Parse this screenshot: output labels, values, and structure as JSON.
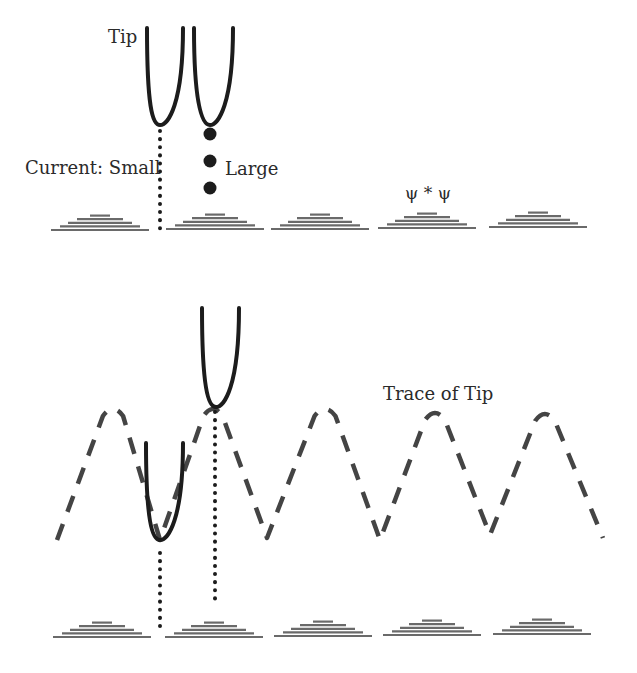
{
  "labels": {
    "tip": "Tip",
    "current_small": "Current: Small",
    "large": "Large",
    "psi": "ψ * ψ",
    "trace": "Trace of Tip"
  },
  "colors": {
    "ink": "#1c1c1c",
    "atom": "#6a6a6a",
    "trace": "#444444",
    "text": "#2a2a2a"
  },
  "top_panel": {
    "tips": [
      {
        "left_x": 147,
        "right_x": 183,
        "top_y": 28,
        "apex_x": 160,
        "apex_y": 125
      },
      {
        "left_x": 194,
        "right_x": 233,
        "top_y": 28,
        "apex_x": 210,
        "apex_y": 125
      }
    ],
    "small_current_line": {
      "x": 160,
      "y1": 131,
      "y2": 230
    },
    "large_current_dots": [
      {
        "x": 210,
        "y": 134
      },
      {
        "x": 210,
        "y": 161
      },
      {
        "x": 210,
        "y": 188
      }
    ],
    "atoms": [
      {
        "cx": 100,
        "base_y": 230
      },
      {
        "cx": 215,
        "base_y": 229
      },
      {
        "cx": 320,
        "base_y": 229
      },
      {
        "cx": 427,
        "base_y": 228
      },
      {
        "cx": 538,
        "base_y": 227
      }
    ]
  },
  "bottom_panel": {
    "tips": [
      {
        "left_x": 202,
        "right_x": 239,
        "top_y": 308,
        "apex_x": 216,
        "apex_y": 407
      },
      {
        "left_x": 146,
        "right_x": 183,
        "top_y": 443,
        "apex_x": 160,
        "apex_y": 540
      }
    ],
    "dotted_lines": [
      {
        "x": 160,
        "y1": 553,
        "y2": 627
      },
      {
        "x": 215,
        "y1": 412,
        "y2": 604
      }
    ],
    "trace_points": [
      [
        57,
        540
      ],
      [
        113,
        408
      ],
      [
        160,
        540
      ],
      [
        213,
        408
      ],
      [
        267,
        538
      ],
      [
        325,
        408
      ],
      [
        380,
        540
      ],
      [
        435,
        412
      ],
      [
        490,
        535
      ],
      [
        545,
        413
      ],
      [
        603,
        538
      ]
    ],
    "atoms": [
      {
        "cx": 102,
        "base_y": 637
      },
      {
        "cx": 214,
        "base_y": 637
      },
      {
        "cx": 323,
        "base_y": 636
      },
      {
        "cx": 432,
        "base_y": 635
      },
      {
        "cx": 542,
        "base_y": 634
      }
    ]
  }
}
